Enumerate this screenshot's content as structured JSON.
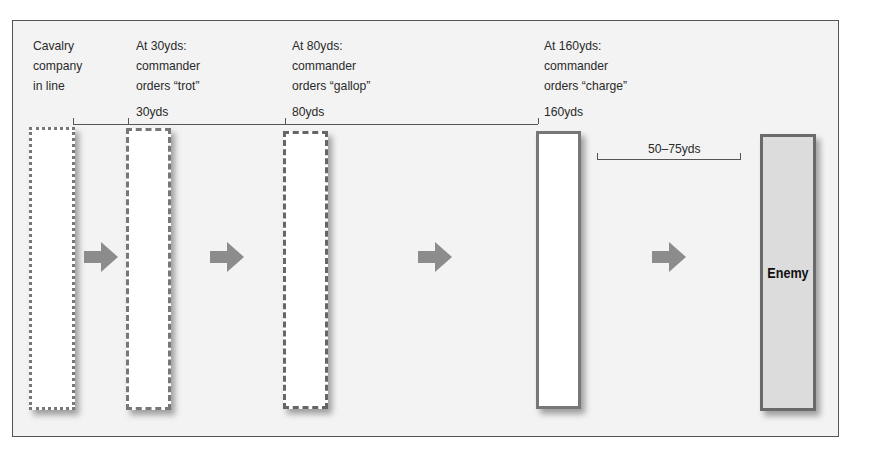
{
  "diagram": {
    "stages": [
      {
        "label_lines": [
          "Cavalry",
          "company",
          "in line"
        ],
        "distance": "",
        "border": "dotted"
      },
      {
        "label_lines": [
          "At 30yds:",
          "commander",
          "orders “trot”"
        ],
        "distance": "30yds",
        "border": "dashed-short"
      },
      {
        "label_lines": [
          "At 80yds:",
          "commander",
          "orders “gallop”"
        ],
        "distance": "80yds",
        "border": "dashed-long"
      },
      {
        "label_lines": [
          "At 160yds:",
          "commander",
          "orders “charge”"
        ],
        "distance": "160yds",
        "border": "solid"
      }
    ],
    "gap_label": "50–75yds",
    "enemy_label": "Enemy",
    "arrow_icon": "right-arrow",
    "colors": {
      "frame_bg": "#f3f3f3",
      "arrow": "#8c8c8c",
      "enemy_fill": "#dcdcdc",
      "line": "#555555"
    }
  }
}
